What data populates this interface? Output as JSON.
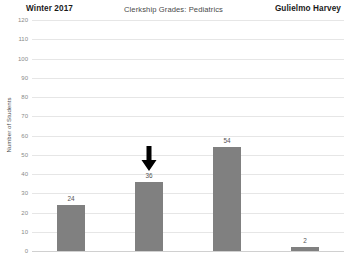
{
  "header": {
    "left": "Winter 2017",
    "center": "Clerkship Grades: Pediatrics",
    "right": "Gulielmo Harvey"
  },
  "chart_data": {
    "type": "bar",
    "title": "Clerkship Grades: Pediatrics",
    "xlabel": "",
    "ylabel": "Number of Students",
    "categories": [
      "",
      "",
      "",
      ""
    ],
    "values": [
      24,
      36,
      54,
      2
    ],
    "data_labels": [
      "24",
      "36",
      "54",
      "2"
    ],
    "ylim": [
      0,
      120
    ],
    "yticks": [
      0,
      10,
      20,
      30,
      40,
      50,
      60,
      70,
      80,
      90,
      100,
      110,
      120
    ],
    "ytick_labels": [
      "0",
      "10",
      "20",
      "30",
      "40",
      "50",
      "60",
      "70",
      "80",
      "90",
      "100",
      "110",
      "120"
    ],
    "grid": true,
    "legend": "none",
    "bar_color": "#808080",
    "gridline_color": "#e6e6e6",
    "annotations": [
      {
        "type": "arrow-down-icon",
        "target_index": 1,
        "color": "#000000"
      }
    ]
  }
}
